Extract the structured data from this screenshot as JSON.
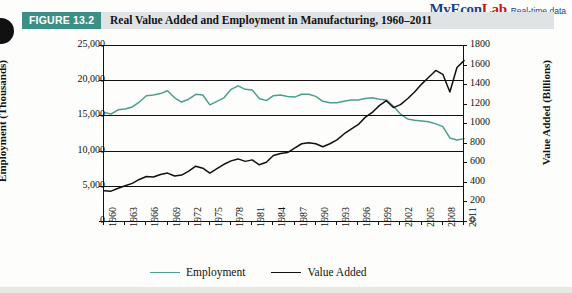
{
  "branding": {
    "name_my": "MyEcon",
    "name_lab": "Lab",
    "tagline": "Real-time data"
  },
  "figure": {
    "tag": "FIGURE  13.2",
    "title": "Real Value Added and Employment in Manufacturing, 1960–2011"
  },
  "chart_data": {
    "type": "line",
    "title": "Real Value Added and Employment in Manufacturing, 1960–2011",
    "xlabel": "",
    "ylabel": "Employment (Thousands)",
    "y2label": "Value Added (Billions)",
    "grid": true,
    "legend_position": "bottom",
    "xlim": [
      1960,
      2011
    ],
    "ylim": [
      0,
      25000
    ],
    "y2lim": [
      0,
      1800
    ],
    "yticks": [
      "0",
      "5,000",
      "10,000",
      "15,000",
      "20,000",
      "25,000"
    ],
    "y2ticks": [
      "0",
      "200",
      "400",
      "600",
      "800",
      "1000",
      "1200",
      "1400",
      "1600",
      "1800"
    ],
    "xticks": [
      "1960",
      "1963",
      "1966",
      "1969",
      "1972",
      "1975",
      "1978",
      "1981",
      "1984",
      "1987",
      "1990",
      "1993",
      "1996",
      "1999",
      "2002",
      "2005",
      "2008",
      "2011"
    ],
    "x": [
      1960,
      1961,
      1962,
      1963,
      1964,
      1965,
      1966,
      1967,
      1968,
      1969,
      1970,
      1971,
      1972,
      1973,
      1974,
      1975,
      1976,
      1977,
      1978,
      1979,
      1980,
      1981,
      1982,
      1983,
      1984,
      1985,
      1986,
      1987,
      1988,
      1989,
      1990,
      1991,
      1992,
      1993,
      1994,
      1995,
      1996,
      1997,
      1998,
      1999,
      2000,
      2001,
      2002,
      2003,
      2004,
      2005,
      2006,
      2007,
      2008,
      2009,
      2010,
      2011
    ],
    "series": [
      {
        "name": "Employment",
        "axis": "left",
        "color": "#4c9e8f",
        "units": "Thousands",
        "values": [
          15400,
          15200,
          15800,
          15900,
          16200,
          16900,
          17800,
          17900,
          18100,
          18500,
          17500,
          16900,
          17300,
          18000,
          17900,
          16500,
          17000,
          17500,
          18700,
          19200,
          18700,
          18600,
          17400,
          17100,
          17800,
          17900,
          17700,
          17600,
          18000,
          18000,
          17700,
          17000,
          16800,
          16800,
          17000,
          17200,
          17200,
          17400,
          17500,
          17300,
          17200,
          16300,
          15200,
          14500,
          14300,
          14200,
          14100,
          13800,
          13400,
          11800,
          11500,
          11700
        ]
      },
      {
        "name": "Value Added",
        "axis": "right",
        "color": "#111111",
        "units": "Billions",
        "values": [
          310,
          305,
          335,
          360,
          385,
          425,
          455,
          450,
          475,
          490,
          460,
          470,
          510,
          560,
          540,
          490,
          535,
          580,
          615,
          635,
          610,
          625,
          575,
          600,
          670,
          690,
          700,
          745,
          790,
          800,
          790,
          760,
          790,
          830,
          890,
          940,
          985,
          1060,
          1110,
          1180,
          1230,
          1160,
          1190,
          1250,
          1320,
          1400,
          1470,
          1540,
          1500,
          1320,
          1570,
          1640
        ]
      }
    ]
  },
  "legend": [
    {
      "label": "Employment",
      "color": "#4c9e8f"
    },
    {
      "label": "Value Added",
      "color": "#111111"
    }
  ]
}
